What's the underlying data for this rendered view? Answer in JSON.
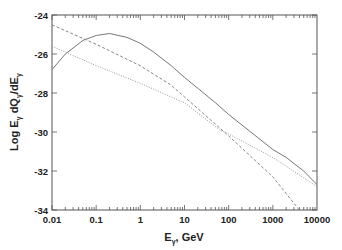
{
  "chart_data": {
    "type": "line",
    "title": "",
    "xlabel": "E_γ, GeV",
    "xlabel_main": "E",
    "xlabel_sub": "γ",
    "xlabel_rest": ", GeV",
    "ylabel": "Log E_γ dQ_γ/dE_γ",
    "ylabel_parts": [
      "Log E",
      "γ",
      " dQ",
      "γ",
      "/dE",
      "γ"
    ],
    "xscale": "log",
    "xlim": [
      0.01,
      10000
    ],
    "ylim": [
      -34,
      -24
    ],
    "grid": false,
    "legend": null,
    "x_ticks": [
      "0.01",
      "0.1",
      "1",
      "10",
      "100",
      "1000",
      "10000"
    ],
    "y_ticks": [
      "-24",
      "-26",
      "-28",
      "-30",
      "-32",
      "-34"
    ],
    "series": [
      {
        "name": "solid",
        "style": "solid",
        "x": [
          0.01,
          0.02,
          0.05,
          0.1,
          0.2,
          0.5,
          1,
          2,
          5,
          10,
          50,
          100,
          1000,
          2000,
          5000,
          10000
        ],
        "y": [
          -26.8,
          -26.0,
          -25.3,
          -25.05,
          -24.95,
          -25.15,
          -25.45,
          -25.9,
          -26.6,
          -27.2,
          -28.5,
          -29.1,
          -30.9,
          -31.3,
          -32.0,
          -32.7
        ]
      },
      {
        "name": "dashed",
        "style": "dashed",
        "x": [
          0.01,
          0.1,
          1,
          5,
          10,
          100,
          1000,
          4000
        ],
        "y": [
          -24.5,
          -25.5,
          -26.6,
          -27.6,
          -28.2,
          -30.2,
          -32.3,
          -34.0
        ]
      },
      {
        "name": "dotted",
        "style": "dotted",
        "x": [
          0.01,
          0.1,
          1,
          5,
          10,
          63,
          100,
          1000,
          10000
        ],
        "y": [
          -25.6,
          -26.6,
          -27.5,
          -28.2,
          -28.5,
          -29.9,
          -30.1,
          -31.3,
          -32.8
        ]
      }
    ]
  },
  "colors": {
    "axis": "#555555",
    "solid": "#777777",
    "dashed": "#888888",
    "dotted": "#999999",
    "text": "#222222"
  }
}
